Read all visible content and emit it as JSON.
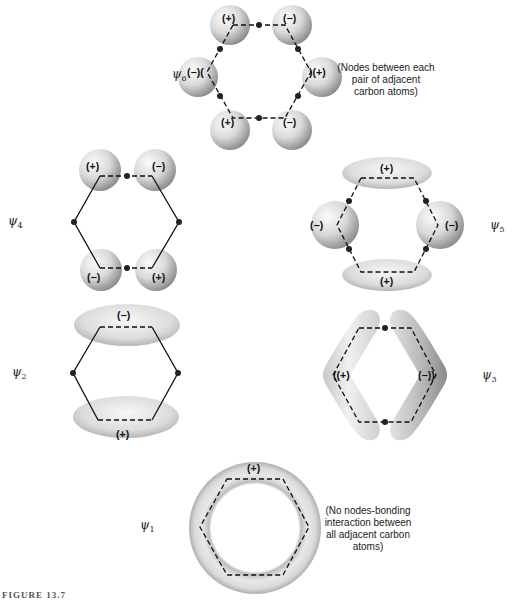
{
  "diagram": {
    "type": "molecular-orbital-diagram",
    "orbitals": [
      {
        "id": "psi6",
        "label_symbol": "ψ",
        "label_sub": "6",
        "lobe_signs": [
          "(+)",
          "(−)",
          "(−)",
          "(+)",
          "(−)",
          "(+)"
        ],
        "note": "(Nodes between each pair of adjacent carbon atoms)",
        "note_lines": [
          "(Nodes between each",
          "pair of adjacent",
          "carbon atoms)"
        ]
      },
      {
        "id": "psi4",
        "label_symbol": "ψ",
        "label_sub": "4",
        "lobe_signs": [
          "(+)",
          "(−)",
          "(−)",
          "(+)"
        ]
      },
      {
        "id": "psi5",
        "label_symbol": "ψ",
        "label_sub": "5",
        "lobe_signs": [
          "(+)",
          "(−)",
          "(−)",
          "(+)"
        ]
      },
      {
        "id": "psi2",
        "label_symbol": "ψ",
        "label_sub": "2",
        "lobe_signs": [
          "(−)",
          "(+)"
        ]
      },
      {
        "id": "psi3",
        "label_symbol": "ψ",
        "label_sub": "3",
        "lobe_signs": [
          "(+)",
          "(−)"
        ]
      },
      {
        "id": "psi1",
        "label_symbol": "ψ",
        "label_sub": "1",
        "lobe_signs": [
          "(+)"
        ],
        "note": "(No nodes-bonding interaction between all adjacent carbon atoms)",
        "note_lines": [
          "(No nodes-bonding",
          "interaction between",
          "all adjacent carbon",
          "atoms)"
        ]
      }
    ],
    "caption": "FIGURE 13.7"
  },
  "colors": {
    "lobe_light": "#f4f4f4",
    "lobe_dark": "#9a9a9a",
    "line": "#111111"
  }
}
